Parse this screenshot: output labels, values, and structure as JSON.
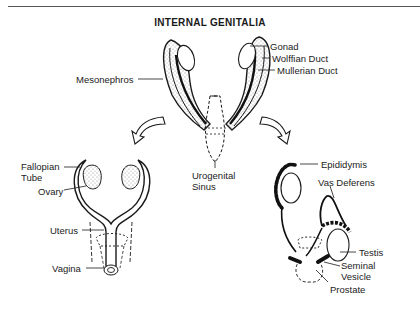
{
  "title": "INTERNAL GENITALIA",
  "indifferent_stage": {
    "labels": {
      "gonad": "Gonad",
      "wolffian_duct": "Wolffian Duct",
      "mullerian_duct": "Mullerian Duct",
      "mesonephros": "Mesonephros",
      "urogenital_sinus_line1": "Urogenital",
      "urogenital_sinus_line2": "Sinus"
    }
  },
  "female": {
    "labels": {
      "fallopian_tube_line1": "Fallopian",
      "fallopian_tube_line2": "Tube",
      "ovary": "Ovary",
      "uterus": "Uterus",
      "vagina": "Vagina"
    }
  },
  "male": {
    "labels": {
      "epididymis": "Epididymis",
      "vas_deferens": "Vas Deferens",
      "testis": "Testis",
      "seminal_vesicle_line1": "Seminal",
      "seminal_vesicle_line2": "Vesicle",
      "prostate": "Prostate"
    }
  },
  "colors": {
    "ink": "#1a1a1a",
    "stipple": "#8a8a8a",
    "background": "#ffffff"
  }
}
